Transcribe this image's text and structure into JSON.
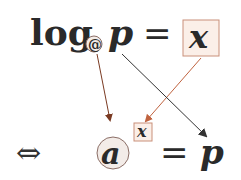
{
  "top_equation": {
    "log": "log",
    "base": "@",
    "argument": "p",
    "equals": "=",
    "result": "x"
  },
  "bottom_equation": {
    "equivalence": "⇔",
    "base": "a",
    "exponent": "x",
    "equals": "=",
    "result": "p"
  },
  "colors": {
    "text": "#2a2a2a",
    "base_circle_fill": "#f3ece8",
    "base_circle_stroke": "#8b6e66",
    "box_fill": "#fbefe8",
    "box_stroke": "#c9907a",
    "arrow_base": "#7a3a22",
    "arrow_exponent": "#c0633f",
    "arrow_result": "#333333"
  }
}
